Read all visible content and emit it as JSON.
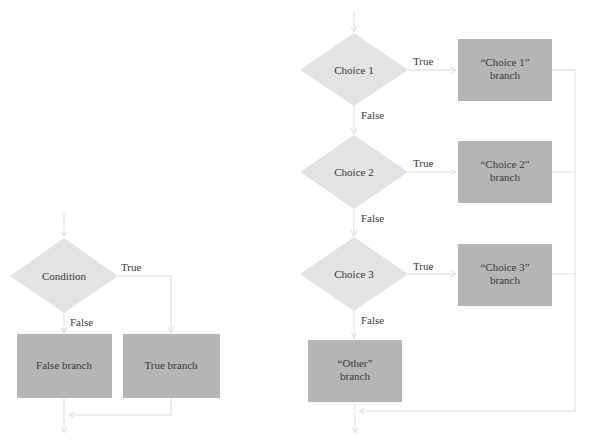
{
  "simple": {
    "condition": "Condition",
    "true_label": "True",
    "false_label": "False",
    "false_branch": "False branch",
    "true_branch": "True branch"
  },
  "multi": {
    "choices": [
      {
        "label": "Choice 1",
        "true_label": "True",
        "false_label": "False",
        "branch_line1": "“Choice 1”",
        "branch_line2": "branch"
      },
      {
        "label": "Choice 2",
        "true_label": "True",
        "false_label": "False",
        "branch_line1": "“Choice 2”",
        "branch_line2": "branch"
      },
      {
        "label": "Choice 3",
        "true_label": "True",
        "false_label": "False",
        "branch_line1": "“Choice 3”",
        "branch_line2": "branch"
      }
    ],
    "other_line1": "“Other”",
    "other_line2": "branch"
  },
  "colors": {
    "decision": "#e3e3e3",
    "process": "#b5b5b5",
    "connector": "#e6e6e6",
    "text": "#3a3a3a"
  }
}
